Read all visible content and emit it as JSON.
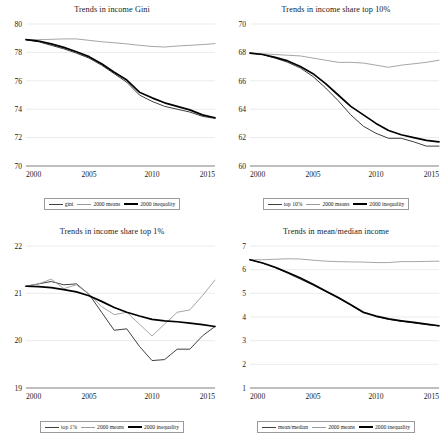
{
  "figure": {
    "panel_count": 4,
    "x_tick_labels": [
      "2000",
      "2005",
      "2010",
      "2015"
    ],
    "colors": {
      "primary_dark": "#3f3f3f",
      "means_light": "#9b9b9b",
      "inequality_black": "#000000",
      "gridline": "#d6d6d6",
      "axis": "#6f6f6f"
    }
  },
  "chart_data": [
    {
      "type": "line",
      "title": "Trends in income Gini",
      "xlabel": "",
      "ylabel": "",
      "grid": true,
      "legend_position": "bottom",
      "x": [
        2000,
        2001,
        2002,
        2003,
        2004,
        2005,
        2006,
        2007,
        2008,
        2009,
        2010,
        2011,
        2012,
        2013,
        2014,
        2015
      ],
      "xlim": [
        2000,
        2015
      ],
      "ylim": [
        70,
        80
      ],
      "yticks": [
        70,
        72,
        74,
        76,
        78,
        80
      ],
      "xticks": [
        2000,
        2005,
        2010,
        2015
      ],
      "series": [
        {
          "name": "gini",
          "color": "#3f3f3f",
          "width": 1.0,
          "values": [
            78.9,
            78.75,
            78.5,
            78.25,
            77.95,
            77.6,
            77.1,
            76.5,
            75.9,
            75.0,
            74.55,
            74.2,
            74.0,
            73.8,
            73.5,
            73.35
          ]
        },
        {
          "name": "2000 means",
          "color": "#9b9b9b",
          "width": 0.9,
          "values": [
            78.9,
            78.9,
            78.92,
            78.95,
            78.95,
            78.85,
            78.75,
            78.68,
            78.6,
            78.5,
            78.42,
            78.38,
            78.45,
            78.5,
            78.55,
            78.62
          ]
        },
        {
          "name": "2000 inequality",
          "color": "#000000",
          "width": 1.7,
          "values": [
            78.9,
            78.8,
            78.6,
            78.35,
            78.05,
            77.7,
            77.2,
            76.6,
            76.05,
            75.2,
            74.8,
            74.45,
            74.2,
            73.95,
            73.6,
            73.4
          ]
        }
      ]
    },
    {
      "type": "line",
      "title": "Trends in income share top 10%",
      "xlabel": "",
      "ylabel": "",
      "grid": true,
      "legend_position": "bottom",
      "x": [
        2000,
        2001,
        2002,
        2003,
        2004,
        2005,
        2006,
        2007,
        2008,
        2009,
        2010,
        2011,
        2012,
        2013,
        2014,
        2015
      ],
      "xlim": [
        2000,
        2015
      ],
      "ylim": [
        60,
        70
      ],
      "yticks": [
        60,
        62,
        64,
        66,
        68,
        70
      ],
      "xticks": [
        2000,
        2005,
        2010,
        2015
      ],
      "series": [
        {
          "name": "top 10%",
          "color": "#3f3f3f",
          "width": 1.0,
          "values": [
            67.95,
            67.85,
            67.6,
            67.3,
            66.9,
            66.3,
            65.5,
            64.6,
            63.6,
            62.8,
            62.3,
            61.95,
            61.95,
            61.7,
            61.4,
            61.4
          ]
        },
        {
          "name": "2000 means",
          "color": "#9b9b9b",
          "width": 0.9,
          "values": [
            67.95,
            67.9,
            67.85,
            67.8,
            67.75,
            67.6,
            67.45,
            67.3,
            67.3,
            67.25,
            67.1,
            66.95,
            67.1,
            67.2,
            67.3,
            67.45
          ]
        },
        {
          "name": "2000 inequality",
          "color": "#000000",
          "width": 1.7,
          "values": [
            67.95,
            67.85,
            67.65,
            67.4,
            67.0,
            66.5,
            65.8,
            65.0,
            64.2,
            63.6,
            63.0,
            62.5,
            62.2,
            62.0,
            61.8,
            61.7
          ]
        }
      ]
    },
    {
      "type": "line",
      "title": "Trends in income share top 1%",
      "xlabel": "",
      "ylabel": "",
      "grid": true,
      "legend_position": "bottom",
      "x": [
        2000,
        2001,
        2002,
        2003,
        2004,
        2005,
        2006,
        2007,
        2008,
        2009,
        2010,
        2011,
        2012,
        2013,
        2014,
        2015
      ],
      "xlim": [
        2000,
        2015
      ],
      "ylim": [
        19,
        22
      ],
      "yticks": [
        19,
        20,
        21,
        22
      ],
      "xticks": [
        2000,
        2005,
        2010,
        2015
      ],
      "series": [
        {
          "name": "top 1%",
          "color": "#3f3f3f",
          "width": 1.0,
          "values": [
            21.15,
            21.2,
            21.25,
            21.18,
            21.2,
            20.98,
            20.6,
            20.22,
            20.25,
            19.88,
            19.58,
            19.6,
            19.82,
            19.82,
            20.1,
            20.3
          ]
        },
        {
          "name": "2000 means",
          "color": "#9b9b9b",
          "width": 0.9,
          "values": [
            21.15,
            21.2,
            21.3,
            21.1,
            21.18,
            20.98,
            20.72,
            20.55,
            20.6,
            20.35,
            20.1,
            20.35,
            20.6,
            20.65,
            20.95,
            21.28
          ]
        },
        {
          "name": "2000 inequality",
          "color": "#000000",
          "width": 1.7,
          "values": [
            21.15,
            21.14,
            21.12,
            21.08,
            21.03,
            20.95,
            20.83,
            20.7,
            20.6,
            20.52,
            20.45,
            20.42,
            20.4,
            20.37,
            20.34,
            20.3
          ]
        }
      ]
    },
    {
      "type": "line",
      "title": "Trends in mean/median income",
      "xlabel": "",
      "ylabel": "",
      "grid": true,
      "legend_position": "bottom",
      "x": [
        2000,
        2001,
        2002,
        2003,
        2004,
        2005,
        2006,
        2007,
        2008,
        2009,
        2010,
        2011,
        2012,
        2013,
        2014,
        2015
      ],
      "xlim": [
        2000,
        2015
      ],
      "ylim": [
        1,
        7
      ],
      "yticks": [
        1,
        2,
        3,
        4,
        5,
        6,
        7
      ],
      "xticks": [
        2000,
        2005,
        2010,
        2015
      ],
      "series": [
        {
          "name": "mean/median",
          "color": "#3f3f3f",
          "width": 1.0,
          "values": [
            6.42,
            6.28,
            6.08,
            5.85,
            5.6,
            5.35,
            5.08,
            4.8,
            4.5,
            4.18,
            4.02,
            3.9,
            3.82,
            3.75,
            3.68,
            3.62
          ]
        },
        {
          "name": "2000 means",
          "color": "#9b9b9b",
          "width": 0.9,
          "values": [
            6.42,
            6.42,
            6.44,
            6.46,
            6.45,
            6.4,
            6.36,
            6.34,
            6.33,
            6.32,
            6.3,
            6.3,
            6.34,
            6.34,
            6.35,
            6.36
          ]
        },
        {
          "name": "2000 inequality",
          "color": "#000000",
          "width": 1.7,
          "values": [
            6.42,
            6.28,
            6.1,
            5.88,
            5.65,
            5.38,
            5.1,
            4.82,
            4.52,
            4.2,
            4.04,
            3.92,
            3.84,
            3.77,
            3.7,
            3.63
          ]
        }
      ]
    }
  ]
}
